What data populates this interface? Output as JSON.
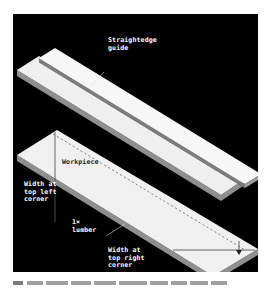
{
  "figure": {
    "labels": {
      "straightedge_guide": "Straightedge\nguide",
      "workpiece": "Workpiece",
      "width_top_left": "Width at\ntop left\ncorner",
      "lumber": "1×\nlumber",
      "width_top_right": "Width at\ntop right\ncorner"
    },
    "colors": {
      "background": "#000000",
      "board_top": "#f2f2f2",
      "board_edge": "#9a9a9a",
      "label": "#ffffff"
    }
  }
}
